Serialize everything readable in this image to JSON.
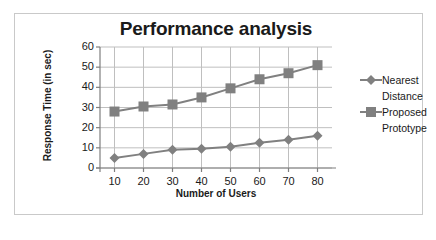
{
  "chart_data": {
    "type": "line",
    "title": "Performance analysis",
    "xlabel": "Number of Users",
    "ylabel": "Response Time (in sec)",
    "x": [
      10,
      20,
      30,
      40,
      50,
      60,
      70,
      80
    ],
    "xticklabels": [
      "10",
      "20",
      "30",
      "40",
      "50",
      "60",
      "70",
      "80"
    ],
    "yticklabels": [
      "0",
      "10",
      "20",
      "30",
      "40",
      "50",
      "60"
    ],
    "yticks": [
      0,
      10,
      20,
      30,
      40,
      50,
      60
    ],
    "xlim": [
      5,
      85
    ],
    "ylim": [
      0,
      60
    ],
    "grid": true,
    "legend_position": "right",
    "series": [
      {
        "name": "Nearest Distance",
        "legend_label_line1": "Nearest",
        "legend_label_line2": "Distance",
        "marker": "diamond",
        "color": "#808080",
        "values": [
          5,
          7,
          9,
          9.5,
          10.5,
          12.5,
          14,
          16
        ]
      },
      {
        "name": "Proposed Prototype",
        "legend_label_line1": "Proposed",
        "legend_label_line2": "Prototype",
        "marker": "square",
        "color": "#808080",
        "values": [
          28,
          30.5,
          31.5,
          35,
          39.5,
          44,
          47,
          51
        ]
      }
    ],
    "colors": {
      "series_line": "#808080",
      "grid": "#bfbfbf",
      "axis": "#7f7f7f",
      "text": "#1a1a1a",
      "frame": "#c9c9c9",
      "background": "#ffffff"
    }
  }
}
